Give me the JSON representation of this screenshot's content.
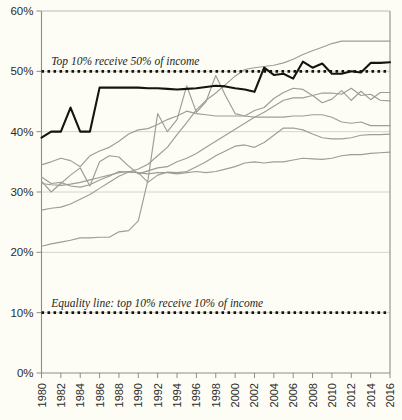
{
  "chart_data": {
    "type": "line",
    "title": "",
    "subtitle": "",
    "xlabel": "",
    "ylabel": "",
    "xlim": [
      1980,
      2016
    ],
    "ylim": [
      0,
      60
    ],
    "y_unit": "%",
    "grid": true,
    "legend": "none",
    "y_ticks": [
      "0%",
      "10%",
      "20%",
      "30%",
      "40%",
      "50%",
      "60%"
    ],
    "y_tick_values": [
      0,
      10,
      20,
      30,
      40,
      50,
      60
    ],
    "x_ticks": [
      "1980",
      "1982",
      "1984",
      "1986",
      "1988",
      "1990",
      "1992",
      "1994",
      "1996",
      "1998",
      "2000",
      "2002",
      "2004",
      "2006",
      "2008",
      "2010",
      "2012",
      "2014",
      "2016"
    ],
    "x_tick_values": [
      1980,
      1982,
      1984,
      1986,
      1988,
      1990,
      1992,
      1994,
      1996,
      1998,
      2000,
      2002,
      2004,
      2006,
      2008,
      2010,
      2012,
      2014,
      2016
    ],
    "x": [
      1980,
      1981,
      1982,
      1983,
      1984,
      1985,
      1986,
      1987,
      1988,
      1989,
      1990,
      1991,
      1992,
      1993,
      1994,
      1995,
      1996,
      1997,
      1998,
      1999,
      2000,
      2001,
      2002,
      2003,
      2004,
      2005,
      2006,
      2007,
      2008,
      2009,
      2010,
      2011,
      2012,
      2013,
      2014,
      2015,
      2016
    ],
    "annotations": [
      {
        "id": "top-annotation",
        "text": "Top 10% receive 50% of income",
        "y_value": 50,
        "x_value": 1981
      },
      {
        "id": "equality-annotation",
        "text": "Equality line: top 10% receive 10% of income",
        "y_value": 10,
        "x_value": 1981
      }
    ],
    "reference_lines": [
      {
        "name": "fifty-percent-line",
        "y_value": 50,
        "style": "dotted",
        "color": "#15150f"
      },
      {
        "name": "equality-line",
        "y_value": 10,
        "style": "dotted",
        "color": "#15150f"
      }
    ],
    "series": [
      {
        "name": "highlighted-series",
        "emphasis": "primary",
        "color": "#15150f",
        "values": [
          39.0,
          40.0,
          40.0,
          44.0,
          40.0,
          40.0,
          47.3,
          47.3,
          47.3,
          47.3,
          47.3,
          47.2,
          47.2,
          47.1,
          47.0,
          47.1,
          47.2,
          47.4,
          47.6,
          47.5,
          47.2,
          47.0,
          46.6,
          50.6,
          49.4,
          49.6,
          48.8,
          51.6,
          50.6,
          51.3,
          49.6,
          49.6,
          50.0,
          49.8,
          51.4,
          51.4,
          51.5
        ]
      },
      {
        "name": "grey-series-1",
        "color": "#9d9d97",
        "values": [
          27.0,
          27.3,
          27.5,
          28.0,
          28.8,
          29.6,
          30.6,
          31.6,
          32.6,
          33.3,
          33.8,
          34.6,
          36.0,
          37.4,
          39.5,
          41.5,
          43.6,
          45.2,
          46.4,
          47.8,
          49.2,
          50.3,
          50.6,
          50.8,
          51.0,
          51.4,
          52.0,
          52.8,
          53.4,
          54.0,
          54.6,
          55.0,
          55.0,
          55.0,
          55.0,
          55.0,
          55.0
        ]
      },
      {
        "name": "grey-series-2",
        "color": "#9d9d97",
        "values": [
          21.0,
          21.4,
          21.7,
          22.0,
          22.4,
          22.4,
          22.5,
          22.5,
          23.4,
          23.6,
          25.2,
          32.0,
          43.0,
          40.0,
          42.0,
          47.6,
          43.2,
          45.0,
          49.3,
          46.0,
          43.0,
          42.6,
          43.5,
          44.0,
          45.5,
          46.5,
          47.2,
          47.0,
          46.0,
          44.8,
          45.4,
          46.8,
          45.2,
          46.7,
          45.3,
          46.5,
          46.5
        ]
      },
      {
        "name": "grey-series-3",
        "color": "#9d9d97",
        "values": [
          31.8,
          30.0,
          31.4,
          32.8,
          34.0,
          31.0,
          35.0,
          36.0,
          35.8,
          34.3,
          33.0,
          33.5,
          34.0,
          34.2,
          35.0,
          35.6,
          36.4,
          37.4,
          38.4,
          39.4,
          40.4,
          41.4,
          42.4,
          43.2,
          44.2,
          45.2,
          45.6,
          45.6,
          46.0,
          46.4,
          46.4,
          46.2,
          47.2,
          46.0,
          46.2,
          45.2,
          45.1
        ]
      },
      {
        "name": "grey-series-4",
        "color": "#9d9d97",
        "values": [
          34.5,
          35.0,
          35.6,
          35.2,
          34.2,
          36.0,
          36.8,
          37.4,
          38.4,
          39.6,
          40.3,
          40.5,
          41.2,
          42.0,
          42.6,
          43.4,
          43.0,
          42.8,
          42.6,
          42.6,
          42.6,
          42.6,
          42.4,
          42.4,
          42.4,
          42.4,
          42.6,
          42.6,
          42.8,
          42.8,
          42.4,
          41.6,
          41.4,
          41.6,
          41.0,
          41.0,
          41.0
        ]
      },
      {
        "name": "grey-series-5",
        "color": "#9d9d97",
        "values": [
          32.5,
          31.4,
          31.6,
          31.0,
          30.8,
          31.2,
          32.0,
          32.6,
          33.4,
          33.3,
          33.2,
          31.6,
          32.8,
          33.3,
          33.2,
          33.4,
          34.2,
          35.0,
          36.0,
          36.8,
          37.6,
          37.8,
          37.4,
          38.2,
          39.4,
          40.6,
          40.6,
          40.3,
          39.6,
          39.0,
          38.8,
          38.8,
          39.0,
          39.4,
          39.5,
          39.5,
          39.6
        ]
      },
      {
        "name": "grey-series-6",
        "color": "#9d9d97",
        "values": [
          31.4,
          31.2,
          31.1,
          31.3,
          31.6,
          32.0,
          32.4,
          32.8,
          33.2,
          33.4,
          33.2,
          33.0,
          33.2,
          33.2,
          33.0,
          33.2,
          33.4,
          33.2,
          33.4,
          33.8,
          34.2,
          34.8,
          35.0,
          34.8,
          35.0,
          35.0,
          35.3,
          35.6,
          35.5,
          35.4,
          35.6,
          36.0,
          36.2,
          36.2,
          36.4,
          36.5,
          36.6
        ]
      }
    ]
  },
  "axes": {
    "y_axis_name": "percent-of-income",
    "x_axis_name": "year"
  }
}
